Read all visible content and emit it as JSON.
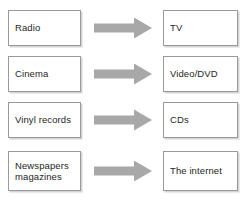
{
  "diagram": {
    "background_color": "#ffffff",
    "box_border_color": "#9a9a9a",
    "box_fill_color": "#ffffff",
    "text_color": "#262626",
    "arrow_color": "#a8a8a8",
    "arrow_icon_name": "right-block-arrow-icon",
    "rows": [
      {
        "source": "Radio",
        "target": "TV"
      },
      {
        "source": "Cinema",
        "target": "Video/DVD"
      },
      {
        "source": "Vinyl records",
        "target": "CDs"
      },
      {
        "source": "Newspapers\nmagazines",
        "target": "The internet"
      }
    ]
  }
}
